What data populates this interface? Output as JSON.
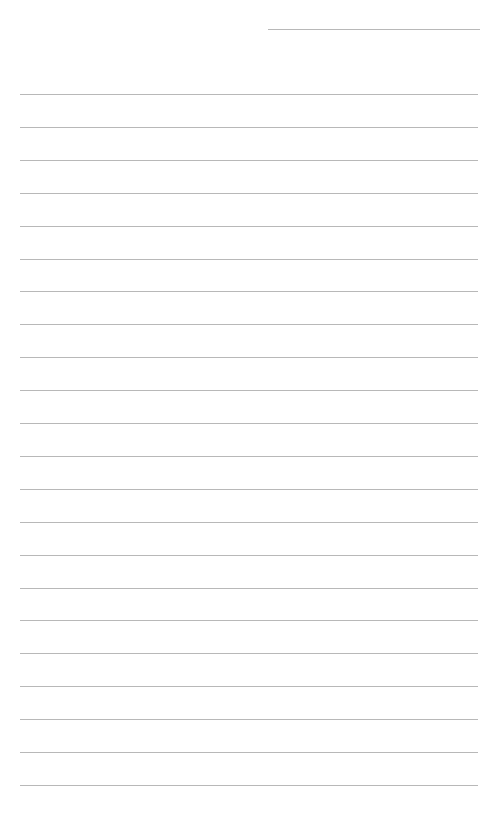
{
  "page": {
    "type": "lined-paper",
    "header_line": {
      "visible": true
    },
    "ruled_line_count": 22,
    "line_color": "#b8b8b8"
  }
}
